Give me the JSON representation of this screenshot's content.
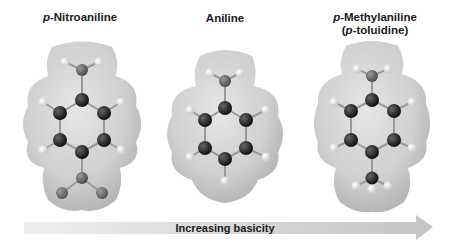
{
  "molecules": [
    {
      "name_prefix": "p",
      "name_rest": "-Nitroaniline",
      "substituent": "NO2",
      "basicity_rank": 1
    },
    {
      "name": "Aniline",
      "substituent": "H",
      "basicity_rank": 2
    },
    {
      "name_prefix": "p",
      "name_rest": "-Methylaniline",
      "alt_open": "(",
      "alt_prefix": "p",
      "alt_rest": "-toluidine)",
      "substituent": "CH3",
      "basicity_rank": 3
    }
  ],
  "arrow": {
    "label": "Increasing basicity",
    "direction": "right"
  },
  "colors": {
    "surface": "#cfcfcf",
    "carbon": "#222222",
    "nitrogen": "#6a6a6a",
    "oxygen": "#7a7a7a",
    "hydrogen": "#e8e8e8",
    "arrow": "#cccccc"
  }
}
